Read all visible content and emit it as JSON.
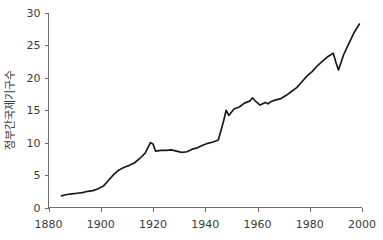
{
  "chart_data": {
    "type": "line",
    "title": "",
    "subtitle": "",
    "xlabel": "",
    "ylabel": "정부간국제기구수",
    "xlim": [
      1880,
      2000
    ],
    "ylim": [
      0,
      30
    ],
    "grid": false,
    "legend": null,
    "legend_position": "none",
    "x_ticks": [
      1880,
      1900,
      1920,
      1940,
      1960,
      1980,
      2000
    ],
    "y_ticks": [
      0,
      5,
      10,
      15,
      20,
      25,
      30
    ],
    "x_tick_labels": [
      "1880",
      "1900",
      "1920",
      "1940",
      "1960",
      "1980",
      "2000"
    ],
    "y_tick_labels": [
      "0",
      "5",
      "10",
      "15",
      "20",
      "25",
      "30"
    ],
    "line_color": "#1a1a1a",
    "axis_color": "#6e6e6e",
    "series": [
      {
        "name": "정부간국제기구수",
        "x": [
          1885,
          1887,
          1889,
          1891,
          1893,
          1895,
          1897,
          1899,
          1901,
          1903,
          1905,
          1907,
          1909,
          1911,
          1913,
          1915,
          1917,
          1919,
          1920,
          1921,
          1923,
          1925,
          1927,
          1929,
          1931,
          1933,
          1935,
          1937,
          1939,
          1941,
          1943,
          1945,
          1947,
          1948,
          1949,
          1951,
          1953,
          1955,
          1957,
          1958,
          1959,
          1961,
          1963,
          1964,
          1965,
          1967,
          1969,
          1971,
          1973,
          1975,
          1977,
          1979,
          1981,
          1983,
          1985,
          1987,
          1989,
          1990,
          1991,
          1993,
          1995,
          1997,
          1999
        ],
        "values": [
          1.8,
          2.0,
          2.1,
          2.2,
          2.3,
          2.5,
          2.6,
          2.9,
          3.3,
          4.2,
          5.1,
          5.8,
          6.2,
          6.5,
          6.9,
          7.6,
          8.4,
          10.0,
          9.8,
          8.7,
          8.8,
          8.8,
          8.9,
          8.7,
          8.5,
          8.6,
          9.0,
          9.2,
          9.6,
          9.9,
          10.1,
          10.4,
          13.3,
          15.0,
          14.2,
          15.2,
          15.5,
          16.1,
          16.4,
          16.9,
          16.5,
          15.8,
          16.2,
          16.0,
          16.3,
          16.6,
          16.8,
          17.3,
          17.9,
          18.5,
          19.4,
          20.3,
          21.0,
          21.9,
          22.6,
          23.3,
          23.8,
          22.4,
          21.2,
          23.6,
          25.3,
          27.0,
          28.3
        ]
      }
    ],
    "annotations": []
  }
}
